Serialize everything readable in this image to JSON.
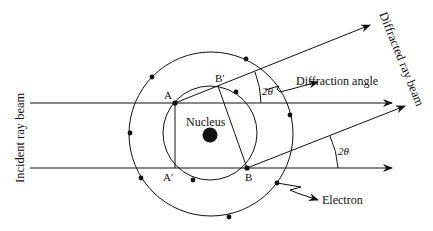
{
  "diagram": {
    "labels": {
      "incident_beam": "Incident ray beam",
      "diffracted_beam": "Diffracted ray beam",
      "diffraction_angle": "Diffraction angle",
      "nucleus": "Nucleus",
      "electron": "Electron",
      "angle_upper": "2θ",
      "angle_lower": "2θ"
    },
    "points": {
      "A": "A",
      "A_prime": "A′",
      "B": "B",
      "B_prime": "B′"
    },
    "colors": {
      "stroke": "#111111",
      "background": "#ffffff"
    }
  }
}
